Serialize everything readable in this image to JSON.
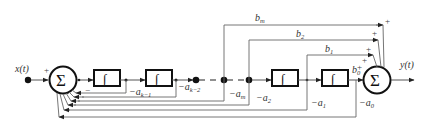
{
  "diagram": {
    "type": "block-diagram",
    "input": {
      "label": "x(t)",
      "sign": "+"
    },
    "output": {
      "label": "y(t)"
    },
    "summers": [
      {
        "id": "input-sum",
        "symbol": "Σ",
        "input_signs": [
          "+",
          "−"
        ]
      },
      {
        "id": "output-sum",
        "symbol": "Σ",
        "input_signs": [
          "+",
          "+",
          "+",
          "+"
        ]
      }
    ],
    "integrators": [
      {
        "id": "int1",
        "symbol": "∫"
      },
      {
        "id": "int2",
        "symbol": "∫"
      },
      {
        "id": "int3",
        "symbol": "∫"
      },
      {
        "id": "int4",
        "symbol": "∫"
      }
    ],
    "feedback_gains": [
      {
        "base": "−a",
        "sub": "k−1"
      },
      {
        "base": "−a",
        "sub": "k−2"
      },
      {
        "base": "−a",
        "sub": "m"
      },
      {
        "base": "−a",
        "sub": "2"
      },
      {
        "base": "−a",
        "sub": "1"
      },
      {
        "base": "−a",
        "sub": "0"
      }
    ],
    "feedforward_gains": [
      {
        "base": "b",
        "sub": "m"
      },
      {
        "base": "b",
        "sub": "2"
      },
      {
        "base": "b",
        "sub": "1"
      },
      {
        "base": "b",
        "sub": "0"
      }
    ],
    "plus_signs": [
      "+",
      "+",
      "+",
      "+",
      "+"
    ],
    "minus_sign": "−"
  }
}
